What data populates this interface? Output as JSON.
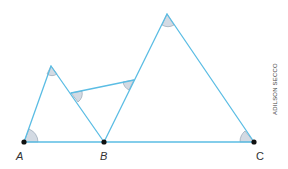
{
  "colors": {
    "line": "#5bbde4",
    "angle_fill": "#d3dae3",
    "angle_stroke": "#8a9bab",
    "point": "#111111"
  },
  "points": {
    "A": {
      "label": "A",
      "x": 24,
      "y": 142
    },
    "B": {
      "label": "B",
      "x": 104,
      "y": 142
    },
    "C": {
      "label": "C",
      "x": 254,
      "y": 142
    },
    "P": {
      "label": "",
      "x": 51,
      "y": 66
    },
    "Q": {
      "label": "",
      "x": 167,
      "y": 14
    },
    "M": {
      "label": "",
      "x": 71,
      "y": 93
    },
    "N": {
      "label": "",
      "x": 134,
      "y": 80
    }
  },
  "labels": {
    "A": "A",
    "B": "B",
    "C": "C"
  },
  "credit": "ADILSON SECCO"
}
